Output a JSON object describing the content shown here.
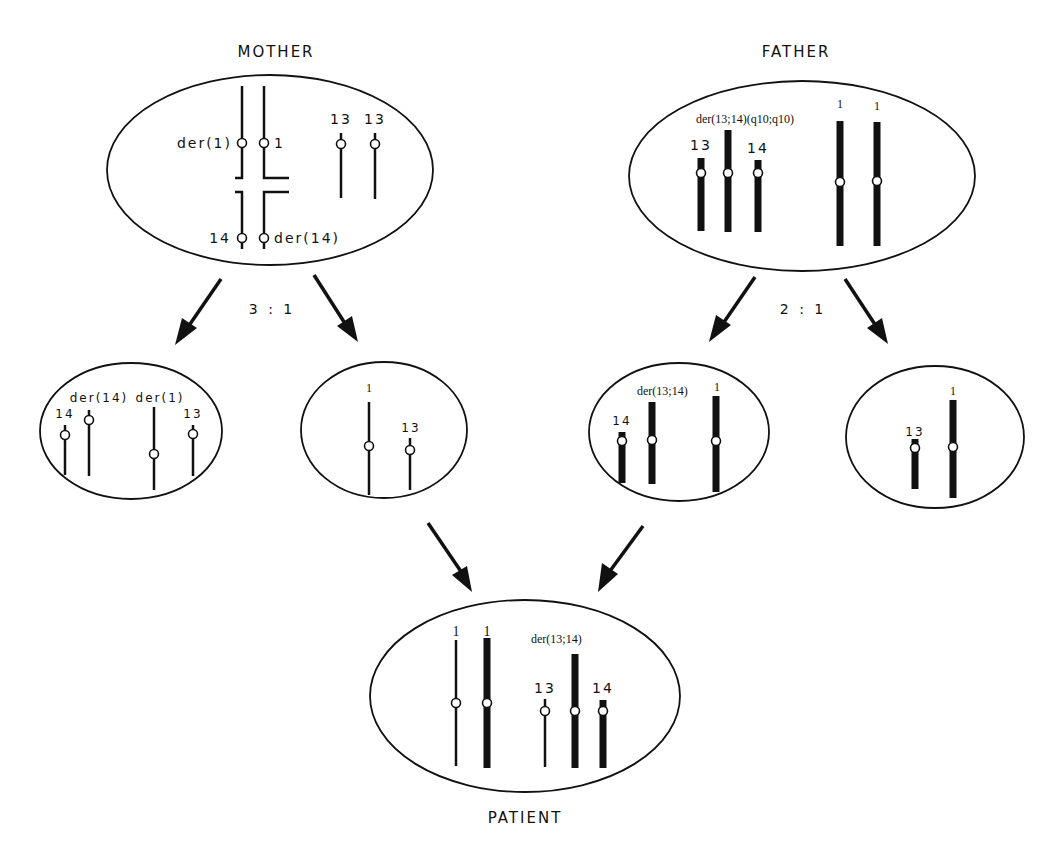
{
  "figure": {
    "colors": {
      "ink": "#111111",
      "background": "#ffffff"
    }
  },
  "mother": {
    "title": "MOTHER",
    "labels": {
      "der1": "der(1)",
      "chr1": "1",
      "chr13a": "13",
      "chr13b": "13",
      "chr14": "14",
      "der14": "der(14)"
    },
    "segregation_ratio": "3 : 1"
  },
  "father": {
    "title": "FATHER",
    "labels": {
      "der1314": "der(13;14)(q10;q10)",
      "chr13": "13",
      "chr14": "14",
      "chr1a": "1",
      "chr1b": "1"
    },
    "segregation_ratio": "2 : 1"
  },
  "mother_gametes": [
    {
      "labels": {
        "chr14": "14",
        "der14": "der(14)",
        "der1": "der(1)",
        "chr13": "13"
      }
    },
    {
      "labels": {
        "chr1": "1",
        "chr13": "13"
      }
    }
  ],
  "father_gametes": [
    {
      "labels": {
        "chr14": "14",
        "der1314": "der(13;14)",
        "chr1": "1"
      }
    },
    {
      "labels": {
        "chr13": "13",
        "chr1": "1"
      }
    }
  ],
  "patient": {
    "title": "PATIENT",
    "labels": {
      "chr1a": "1",
      "chr1b": "1",
      "der1314": "der(13;14)",
      "chr13": "13",
      "chr14": "14"
    }
  }
}
